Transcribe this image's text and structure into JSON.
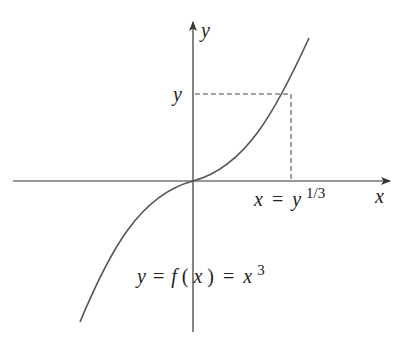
{
  "diagram": {
    "type": "function-graph",
    "function": "y = x^3",
    "axes": {
      "x_label": "x",
      "y_label": "y"
    },
    "labels": {
      "y_level": "y",
      "inverse": {
        "lhs": "x",
        "eq": "=",
        "base": "y",
        "exp": "1/3"
      },
      "function": {
        "text_y": "y",
        "eq1": "=",
        "f": "f",
        "paren_open": "(",
        "x": "x",
        "paren_close": ")",
        "eq2": "=",
        "base": "x",
        "exp": "3"
      }
    },
    "colors": {
      "axis": "#333333",
      "curve": "#555555",
      "dashed": "#444444",
      "text": "#222222"
    }
  }
}
